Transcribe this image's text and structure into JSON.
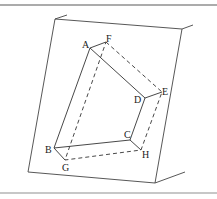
{
  "figure": {
    "border_color": "#9a9a9a",
    "line_color": "#333333",
    "labels": {
      "A": "A",
      "B": "B",
      "C": "C",
      "D": "D",
      "E": "E",
      "F": "F",
      "G": "G",
      "H": "H"
    }
  }
}
